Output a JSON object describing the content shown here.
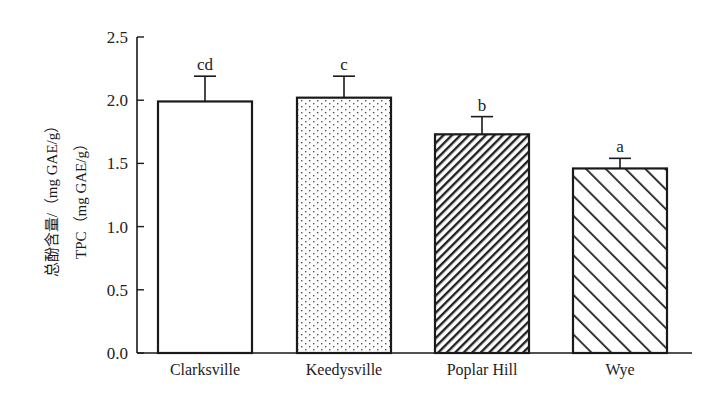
{
  "chart_data": {
    "type": "bar",
    "title": "",
    "xlabel": "",
    "ylabel": "总酚含量/（mg GAE/g） TPC（mg GAE/g）",
    "ylabel_lines": [
      "总酚含量/（mg GAE/g）",
      "TPC（mg GAE/g）"
    ],
    "ylim": [
      0,
      2.5
    ],
    "yticks": [
      0.0,
      0.5,
      1.0,
      1.5,
      2.0,
      2.5
    ],
    "ytick_labels": [
      "0.0",
      "0.5",
      "1.0",
      "1.5",
      "2.0",
      "2.5"
    ],
    "grid": false,
    "legend": null,
    "categories": [
      "Clarksville",
      "Keedysville",
      "Poplar Hill",
      "Wye"
    ],
    "values": [
      1.99,
      2.02,
      1.73,
      1.46
    ],
    "errors": [
      0.2,
      0.17,
      0.14,
      0.08
    ],
    "significance_letters": [
      "cd",
      "c",
      "b",
      "a"
    ],
    "fill_patterns": [
      "none",
      "dots",
      "dense-forward-hatch",
      "sparse-back-hatch"
    ]
  }
}
